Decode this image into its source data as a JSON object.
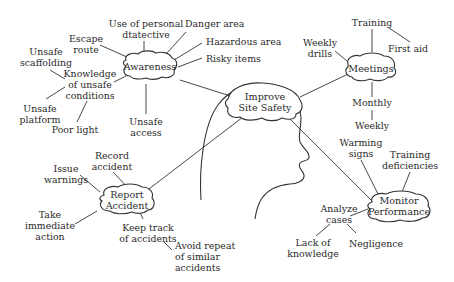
{
  "diagram": {
    "title": "Improve Site Safety",
    "center": {
      "id": "center",
      "label": "Improve\nSite Safety"
    },
    "nodes": [
      {
        "id": "awareness",
        "label": "Awareness"
      },
      {
        "id": "meetings",
        "label": "Meetings"
      },
      {
        "id": "report",
        "label": "Report\nAccident"
      },
      {
        "id": "monitor",
        "label": "Monitor\nPerformance"
      }
    ],
    "leaves": {
      "escape_route": "Escape\nroute",
      "personal_detective": "Use of personal\ndtatective",
      "danger_area": "Danger area",
      "hazardous_area": "Hazardous area",
      "risky_items": "Risky items",
      "unsafe_scaffolding": "Unsafe\nscaffolding",
      "knowledge_unsafe": "Knowledge\nof unsafe\nconditions",
      "unsafe_platform": "Unsafe\nplatform",
      "poor_light": "Poor light",
      "unsafe_access": "Unsafe\naccess",
      "training": "Training",
      "first_aid": "First aid",
      "weekly_drills": "Weekly\ndrills",
      "monthly": "Monthly",
      "weekly": "Weekly",
      "record_accident": "Record\naccident",
      "issue_warnings": "Issue\nwarnings",
      "take_action": "Take\nimmediate\naction",
      "keep_track": "Keep track\nof accidents",
      "avoid_repeat": "Avoid repeat\nof similar\naccidents",
      "warming_signs": "Warming\nsigns",
      "training_deficiencies": "Training\ndeficiencies",
      "analyze_cases": "Analyze\ncases",
      "lack_knowledge": "Lack of\nknowledge",
      "negligence": "Negligence"
    },
    "edges": [
      [
        "center",
        "awareness"
      ],
      [
        "center",
        "meetings"
      ],
      [
        "center",
        "report"
      ],
      [
        "center",
        "monitor"
      ],
      [
        "awareness",
        "escape_route"
      ],
      [
        "awareness",
        "personal_detective"
      ],
      [
        "awareness",
        "danger_area"
      ],
      [
        "awareness",
        "hazardous_area"
      ],
      [
        "awareness",
        "risky_items"
      ],
      [
        "awareness",
        "knowledge_unsafe"
      ],
      [
        "awareness",
        "unsafe_access"
      ],
      [
        "knowledge_unsafe",
        "unsafe_scaffolding"
      ],
      [
        "knowledge_unsafe",
        "unsafe_platform"
      ],
      [
        "knowledge_unsafe",
        "poor_light"
      ],
      [
        "meetings",
        "training"
      ],
      [
        "meetings",
        "weekly_drills"
      ],
      [
        "meetings",
        "monthly"
      ],
      [
        "training",
        "first_aid"
      ],
      [
        "monthly",
        "weekly"
      ],
      [
        "report",
        "record_accident"
      ],
      [
        "report",
        "issue_warnings"
      ],
      [
        "report",
        "take_action"
      ],
      [
        "report",
        "keep_track"
      ],
      [
        "keep_track",
        "avoid_repeat"
      ],
      [
        "monitor",
        "warming_signs"
      ],
      [
        "monitor",
        "training_deficiencies"
      ],
      [
        "monitor",
        "analyze_cases"
      ],
      [
        "analyze_cases",
        "lack_knowledge"
      ],
      [
        "analyze_cases",
        "negligence"
      ]
    ],
    "colors": {
      "stroke": "#333333",
      "text": "#2a2a2a",
      "background": "#ffffff"
    }
  }
}
